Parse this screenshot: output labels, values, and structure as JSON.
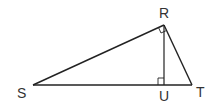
{
  "diagram": {
    "type": "right-triangle-with-altitude",
    "colors": {
      "stroke": "#222222",
      "label": "#333333",
      "background": "#ffffff"
    },
    "vertices": [
      {
        "id": "S",
        "label": "S",
        "x": 33,
        "y": 85
      },
      {
        "id": "R",
        "label": "R",
        "x": 164,
        "y": 25
      },
      {
        "id": "T",
        "label": "T",
        "x": 192,
        "y": 85
      },
      {
        "id": "U",
        "label": "U",
        "x": 164,
        "y": 85
      }
    ],
    "segments": [
      {
        "from": "S",
        "to": "R"
      },
      {
        "from": "R",
        "to": "T"
      },
      {
        "from": "S",
        "to": "T"
      },
      {
        "from": "R",
        "to": "U"
      }
    ],
    "right_angles": [
      {
        "at": "R",
        "between": [
          "S",
          "T"
        ]
      },
      {
        "at": "U",
        "between": [
          "S",
          "R"
        ]
      }
    ],
    "labels": {
      "S": "S",
      "R": "R",
      "T": "T",
      "U": "U"
    }
  }
}
